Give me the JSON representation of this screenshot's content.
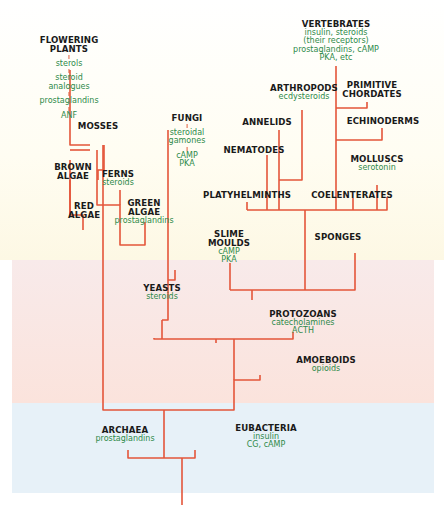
{
  "diagram": {
    "title": "",
    "colors": {
      "line": "#e4553a",
      "name_text": "#1a1a1a",
      "chemical_text": "#2e8a4a",
      "band_top": "#fdf8e4",
      "band_middle": "#fbe3dc",
      "band_bottom": "#e7f1f8"
    },
    "nodes": {
      "flowering_plants": {
        "name": [
          "FLOWERING",
          "PLANTS"
        ],
        "chemicals": [
          "sterols",
          "steroid",
          "analogues",
          "prostaglandins",
          "ANF"
        ]
      },
      "mosses": {
        "name": [
          "MOSSES"
        ]
      },
      "ferns": {
        "name": [
          "FERNS"
        ],
        "chemicals": [
          "steroids"
        ]
      },
      "brown_algae": {
        "name": [
          "BROWN",
          "ALGAE"
        ]
      },
      "red_algae": {
        "name": [
          "RED",
          "ALGAE"
        ]
      },
      "green_algae": {
        "name": [
          "GREEN",
          "ALGAE"
        ],
        "chemicals": [
          "prostaglandins"
        ]
      },
      "fungi": {
        "name": [
          "FUNGI"
        ],
        "chemicals": [
          "steroidal",
          "gamones",
          "cAMP",
          "PKA"
        ]
      },
      "vertebrates": {
        "name": [
          "VERTEBRATES"
        ],
        "chemicals": [
          "insulin, steroids",
          "(their receptors)",
          "prostaglandins, cAMP",
          "PKA, etc"
        ]
      },
      "arthropods": {
        "name": [
          "ARTHROPODS"
        ],
        "chemicals": [
          "ecdysteroids"
        ]
      },
      "primitive_chordates": {
        "name": [
          "PRIMITIVE",
          "CHORDATES"
        ]
      },
      "annelids": {
        "name": [
          "ANNELIDS"
        ]
      },
      "echinoderms": {
        "name": [
          "ECHINODERMS"
        ]
      },
      "nematodes": {
        "name": [
          "NEMATODES"
        ]
      },
      "molluscs": {
        "name": [
          "MOLLUSCS"
        ],
        "chemicals": [
          "serotonin"
        ]
      },
      "platyhelminths": {
        "name": [
          "PLATYHELMINTHS"
        ]
      },
      "coelenterates": {
        "name": [
          "COELENTERATES"
        ]
      },
      "slime_moulds": {
        "name": [
          "SLIME",
          "MOULDS"
        ],
        "chemicals": [
          "cAMP",
          "PKA"
        ]
      },
      "sponges": {
        "name": [
          "SPONGES"
        ]
      },
      "yeasts": {
        "name": [
          "YEASTS"
        ],
        "chemicals": [
          "steroids"
        ]
      },
      "protozoans": {
        "name": [
          "PROTOZOANS"
        ],
        "chemicals": [
          "catecholamines",
          "ACTH"
        ]
      },
      "amoeboids": {
        "name": [
          "AMOEBOIDS"
        ],
        "chemicals": [
          "opioids"
        ]
      },
      "archaea": {
        "name": [
          "ARCHAEA"
        ],
        "chemicals": [
          "prostaglandins"
        ]
      },
      "eubacteria": {
        "name": [
          "EUBACTERIA"
        ],
        "chemicals": [
          "insulin",
          "CG, cAMP"
        ]
      }
    }
  }
}
